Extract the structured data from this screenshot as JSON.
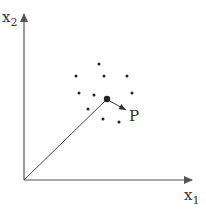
{
  "diagram": {
    "axes": {
      "x_label": "x",
      "x_subscript": "1",
      "y_label": "x",
      "y_subscript": "2"
    },
    "point_label": "P",
    "colors": {
      "axis": "#555555",
      "dot": "#222222",
      "vector": "#444444",
      "text": "#333333"
    }
  }
}
